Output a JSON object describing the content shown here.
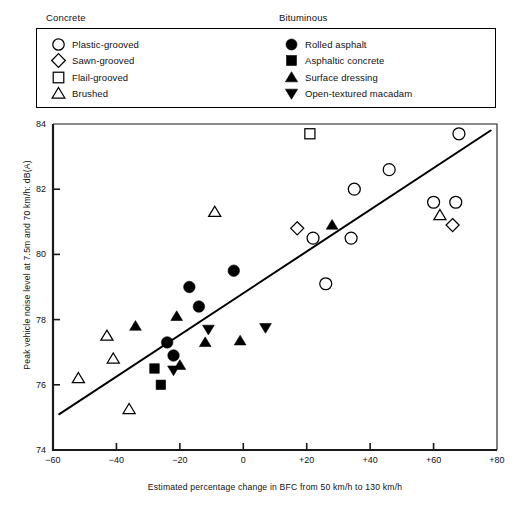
{
  "legend": {
    "groups": [
      {
        "title": "Concrete",
        "items": [
          {
            "label": "Plastic-grooved",
            "marker": "circle-open",
            "icon_name": "circle-open-icon"
          },
          {
            "label": "Sawn-grooved",
            "marker": "diamond-open",
            "icon_name": "diamond-open-icon"
          },
          {
            "label": "Flail-grooved",
            "marker": "square-open",
            "icon_name": "square-open-icon"
          },
          {
            "label": "Brushed",
            "marker": "triangle-up-open",
            "icon_name": "triangle-up-open-icon"
          }
        ]
      },
      {
        "title": "Bituminous",
        "items": [
          {
            "label": "Rolled asphalt",
            "marker": "circle-filled",
            "icon_name": "circle-filled-icon"
          },
          {
            "label": "Asphaltic concrete",
            "marker": "square-filled",
            "icon_name": "square-filled-icon"
          },
          {
            "label": "Surface dressing",
            "marker": "triangle-up-filled",
            "icon_name": "triangle-up-filled-icon"
          },
          {
            "label": "Open-textured macadam",
            "marker": "triangle-down-filled",
            "icon_name": "triangle-down-filled-icon"
          }
        ]
      }
    ]
  },
  "chart_data": {
    "type": "scatter",
    "title": "",
    "xlabel": "Estimated percentage change in BFC from 50 km/h to 130 km/h",
    "ylabel": "Peak vehicle noise level at 7.5m and 70 km/h: dB(A)",
    "xlim": [
      -60,
      80
    ],
    "ylim": [
      74,
      84
    ],
    "xticks": [
      -60,
      -40,
      -20,
      0,
      20,
      40,
      60,
      80
    ],
    "xticklabels": [
      "−60",
      "−40",
      "−20",
      "0",
      "+20",
      "+40",
      "+60",
      "+80"
    ],
    "yticks": [
      74,
      76,
      78,
      80,
      82,
      84
    ],
    "yticklabels": [
      "74",
      "76",
      "78",
      "80",
      "82",
      "84"
    ],
    "grid": false,
    "legend_position": "above-plot",
    "marker_color": "#000000",
    "line_color": "#000000",
    "trendline": {
      "label": "regression line",
      "x": [
        -58,
        78
      ],
      "y": [
        75.1,
        83.8
      ]
    },
    "series": [
      {
        "name": "Plastic-grooved",
        "marker": "circle-open",
        "points": [
          {
            "x": 22,
            "y": 80.5
          },
          {
            "x": 26,
            "y": 79.1
          },
          {
            "x": 34,
            "y": 80.5
          },
          {
            "x": 35,
            "y": 82.0
          },
          {
            "x": 46,
            "y": 82.6
          },
          {
            "x": 60,
            "y": 81.6
          },
          {
            "x": 67,
            "y": 81.6
          },
          {
            "x": 68,
            "y": 83.7
          }
        ]
      },
      {
        "name": "Sawn-grooved",
        "marker": "diamond-open",
        "points": [
          {
            "x": 17,
            "y": 80.8
          },
          {
            "x": 66,
            "y": 80.9
          }
        ]
      },
      {
        "name": "Flail-grooved",
        "marker": "square-open",
        "points": [
          {
            "x": 21,
            "y": 83.7
          }
        ]
      },
      {
        "name": "Brushed",
        "marker": "triangle-up-open",
        "points": [
          {
            "x": -52,
            "y": 76.2
          },
          {
            "x": -43,
            "y": 77.5
          },
          {
            "x": -41,
            "y": 76.8
          },
          {
            "x": -36,
            "y": 75.25
          },
          {
            "x": -9,
            "y": 81.3
          },
          {
            "x": 62,
            "y": 81.2
          }
        ]
      },
      {
        "name": "Rolled asphalt",
        "marker": "circle-filled",
        "points": [
          {
            "x": -24,
            "y": 77.3
          },
          {
            "x": -22,
            "y": 76.9
          },
          {
            "x": -17,
            "y": 79.0
          },
          {
            "x": -14,
            "y": 78.4
          },
          {
            "x": -3,
            "y": 79.5
          }
        ]
      },
      {
        "name": "Asphaltic concrete",
        "marker": "square-filled",
        "points": [
          {
            "x": -28,
            "y": 76.5
          },
          {
            "x": -26,
            "y": 76.0
          }
        ]
      },
      {
        "name": "Surface dressing",
        "marker": "triangle-up-filled",
        "points": [
          {
            "x": -34,
            "y": 77.8
          },
          {
            "x": -21,
            "y": 78.1
          },
          {
            "x": -20,
            "y": 76.6
          },
          {
            "x": -12,
            "y": 77.3
          },
          {
            "x": -1,
            "y": 77.35
          },
          {
            "x": 28,
            "y": 80.9
          }
        ]
      },
      {
        "name": "Open-textured macadam",
        "marker": "triangle-down-filled",
        "points": [
          {
            "x": -22,
            "y": 76.45
          },
          {
            "x": -11,
            "y": 77.7
          },
          {
            "x": 7,
            "y": 77.75
          }
        ]
      }
    ]
  }
}
